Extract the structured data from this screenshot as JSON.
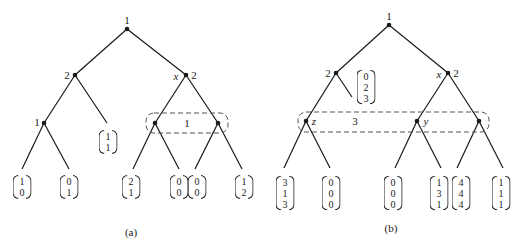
{
  "figure_a": {
    "caption": "(a)",
    "nodes": {
      "root": {
        "player": "1"
      },
      "left": {
        "player": "2"
      },
      "right": {
        "player": "2",
        "name": "x"
      },
      "leftleft": {
        "player": "1"
      },
      "info_set_label": "1"
    },
    "payoffs": [
      [
        "1",
        "0"
      ],
      [
        "0",
        "1"
      ],
      [
        "1",
        "1"
      ],
      [
        "2",
        "1"
      ],
      [
        "0",
        "0"
      ],
      [
        "0",
        "0"
      ],
      [
        "1",
        "2"
      ]
    ]
  },
  "figure_b": {
    "caption": "(b)",
    "nodes": {
      "root": {
        "player": "1"
      },
      "left": {
        "player": "2"
      },
      "right": {
        "player": "2",
        "name": "x"
      },
      "z_name": "z",
      "y_name": "y",
      "info_set_label": "3"
    },
    "payoffs": [
      [
        "0",
        "2",
        "3"
      ],
      [
        "3",
        "1",
        "3"
      ],
      [
        "0",
        "0",
        "0"
      ],
      [
        "0",
        "0",
        "0"
      ],
      [
        "1",
        "3",
        "1"
      ],
      [
        "4",
        "4",
        "4"
      ],
      [
        "1",
        "1",
        "1"
      ]
    ]
  }
}
